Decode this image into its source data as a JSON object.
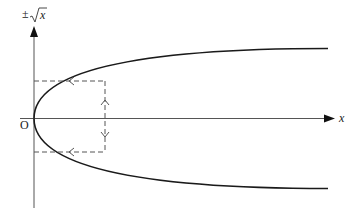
{
  "diagram": {
    "y_axis_label_prefix": "±",
    "y_axis_label_radicand": "x",
    "x_axis_label": "x",
    "origin_label": "O",
    "curve": "y^2 = x (parabola opening right, upper and lower branches ±√x)",
    "annotations": [
      "vertical dashed double-arrow between upper and lower branch at a given x",
      "horizontal dashed arrows from curve points pointing left to the y-axis"
    ],
    "colors": {
      "curve": "#1a1a1a",
      "axis": "#555555",
      "dashed": "#555555"
    }
  }
}
